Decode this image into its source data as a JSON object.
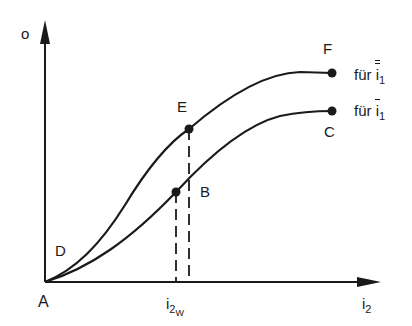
{
  "diagram": {
    "y_axis_label": "o",
    "x_axis_label": {
      "base": "i",
      "sub": "2"
    },
    "origin_label": "A",
    "x_marker_label": {
      "base": "i",
      "sub": "2",
      "subsub": "W"
    },
    "points": {
      "D": "D",
      "B": "B",
      "E": "E",
      "C": "C",
      "F": "F"
    },
    "curves": [
      {
        "name": "upper",
        "end_point": "F",
        "legend": {
          "prefix": "für",
          "base": "i",
          "sub": "1",
          "bars": 2
        }
      },
      {
        "name": "lower",
        "end_point": "C",
        "legend": {
          "prefix": "für",
          "base": "i",
          "sub": "1",
          "bars": 1
        }
      }
    ],
    "colors": {
      "ink": "#1a1a1a",
      "background": "#ffffff"
    }
  }
}
